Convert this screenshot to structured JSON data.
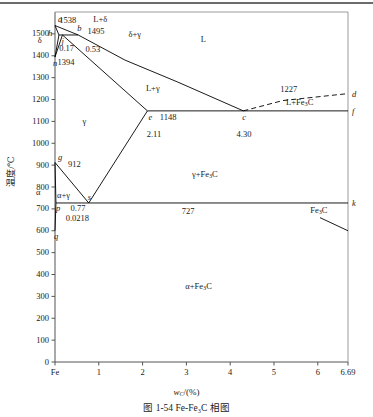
{
  "figure": {
    "caption": "图 1-54   Fe-Fe₃C 相图",
    "xlabel": "wC/(%)",
    "ylabel": "温度/℃",
    "top_rule_color": "#6b6b6b",
    "line_color": "#000000",
    "axis_color": "#555555"
  },
  "chart_data": {
    "type": "line",
    "title": "图 1-54   Fe-Fe₃C 相图",
    "xlabel": "wC/(%)",
    "ylabel": "温度/℃",
    "xlim": [
      0,
      6.69
    ],
    "ylim": [
      0,
      1600
    ],
    "grid": false,
    "legend": "none",
    "x_ticks": [
      {
        "value": 0,
        "label": "Fe"
      },
      {
        "value": 1,
        "label": "1"
      },
      {
        "value": 2,
        "label": "2"
      },
      {
        "value": 3,
        "label": "3"
      },
      {
        "value": 4,
        "label": "4"
      },
      {
        "value": 5,
        "label": "5"
      },
      {
        "value": 6,
        "label": "6"
      },
      {
        "value": 6.69,
        "label": "6.69"
      }
    ],
    "y_ticks": [
      {
        "value": 0,
        "label": "0"
      },
      {
        "value": 100,
        "label": "100"
      },
      {
        "value": 200,
        "label": "200"
      },
      {
        "value": 300,
        "label": "300"
      },
      {
        "value": 400,
        "label": "400"
      },
      {
        "value": 500,
        "label": "500"
      },
      {
        "value": 600,
        "label": "600"
      },
      {
        "value": 700,
        "label": "700"
      },
      {
        "value": 800,
        "label": "800"
      },
      {
        "value": 900,
        "label": "900"
      },
      {
        "value": 1000,
        "label": "1000"
      },
      {
        "value": 1100,
        "label": "1100"
      },
      {
        "value": 1200,
        "label": "1200"
      },
      {
        "value": 1300,
        "label": "1300"
      },
      {
        "value": 1400,
        "label": "1400"
      },
      {
        "value": 1500,
        "label": "1500"
      }
    ],
    "invariant_points": [
      {
        "id": "a",
        "label": "a",
        "wc": 0.0,
        "t": 1538
      },
      {
        "id": "h",
        "label": "h",
        "wc": 0.09,
        "t": 1495
      },
      {
        "id": "b",
        "label": "b",
        "wc": 0.53,
        "t": 1495
      },
      {
        "id": "j",
        "label": "j",
        "wc": 0.17,
        "t": 1495
      },
      {
        "id": "n",
        "label": "n",
        "wc": 0.0,
        "t": 1394
      },
      {
        "id": "e",
        "label": "e",
        "wc": 2.11,
        "t": 1148
      },
      {
        "id": "c",
        "label": "c",
        "wc": 4.3,
        "t": 1148
      },
      {
        "id": "f",
        "label": "f",
        "wc": 6.69,
        "t": 1148
      },
      {
        "id": "d",
        "label": "d",
        "wc": 6.69,
        "t": 1227
      },
      {
        "id": "g",
        "label": "g",
        "wc": 0.0,
        "t": 912
      },
      {
        "id": "s",
        "label": "s",
        "wc": 0.77,
        "t": 727
      },
      {
        "id": "p",
        "label": "p",
        "wc": 0.0218,
        "t": 727
      },
      {
        "id": "k",
        "label": "k",
        "wc": 6.69,
        "t": 727
      },
      {
        "id": "q",
        "label": "q",
        "wc": 0.0,
        "t": 600
      }
    ],
    "value_annotations": [
      {
        "text": "1538",
        "wc": 0.3,
        "t": 1560
      },
      {
        "text": "1495",
        "wc": 0.95,
        "t": 1512
      },
      {
        "text": "0.17",
        "wc": 0.3,
        "t": 1432
      },
      {
        "text": "0.53",
        "wc": 0.9,
        "t": 1430
      },
      {
        "text": "1394",
        "wc": 0.26,
        "t": 1370
      },
      {
        "text": "1227",
        "wc": 5.35,
        "t": 1245
      },
      {
        "text": "1148",
        "wc": 2.6,
        "t": 1120
      },
      {
        "text": "2.11",
        "wc": 2.3,
        "t": 1040
      },
      {
        "text": "4.30",
        "wc": 4.35,
        "t": 1040
      },
      {
        "text": "912",
        "wc": 0.5,
        "t": 905
      },
      {
        "text": "0.77",
        "wc": 0.56,
        "t": 700
      },
      {
        "text": "0.0218",
        "wc": 0.45,
        "t": 655
      },
      {
        "text": "727",
        "wc": 3.1,
        "t": 690
      }
    ],
    "phase_regions": [
      {
        "label": "L",
        "wc": 3.6,
        "t": 1470
      },
      {
        "label": "L+δ",
        "wc": 1.15,
        "t": 1562
      },
      {
        "label": "δ+γ",
        "wc": 1.95,
        "t": 1497
      },
      {
        "label": "δ",
        "wc": -0.12,
        "t": 1468
      },
      {
        "label": "L+γ",
        "wc": 2.35,
        "t": 1250
      },
      {
        "label": "L+Fe₃C",
        "wc": 5.55,
        "t": 1185
      },
      {
        "label": "γ",
        "wc": 0.9,
        "t": 1095
      },
      {
        "label": "γ+Fe₃C",
        "wc": 3.4,
        "t": 855
      },
      {
        "label": "α+γ",
        "wc": 0.32,
        "t": 760
      },
      {
        "label": "α",
        "wc": -0.16,
        "t": 772
      },
      {
        "label": "α+Fe₃C",
        "wc": 3.25,
        "t": 345
      },
      {
        "label": "Fe₃C",
        "wc": 6.1,
        "t": 690
      }
    ],
    "series": [
      {
        "name": "liquidus-AB-BC",
        "style": "solid",
        "points": [
          [
            0,
            1538
          ],
          [
            0.53,
            1495
          ],
          [
            1.6,
            1380
          ],
          [
            2.8,
            1280
          ],
          [
            4.3,
            1148
          ]
        ]
      },
      {
        "name": "liquidus-CD-dashed",
        "style": "dashed",
        "points": [
          [
            4.3,
            1148
          ],
          [
            5.2,
            1195
          ],
          [
            6.69,
            1227
          ]
        ]
      },
      {
        "name": "solidus-AH",
        "style": "solid",
        "points": [
          [
            0,
            1538
          ],
          [
            0.09,
            1495
          ]
        ]
      },
      {
        "name": "solvus-HN",
        "style": "solid",
        "points": [
          [
            0.09,
            1495
          ],
          [
            0,
            1394
          ]
        ]
      },
      {
        "name": "peritectic-HJB",
        "style": "solid",
        "points": [
          [
            0.09,
            1495
          ],
          [
            0.53,
            1495
          ]
        ]
      },
      {
        "name": "solidus-JE",
        "style": "solid",
        "points": [
          [
            0.17,
            1495
          ],
          [
            2.11,
            1148
          ]
        ]
      },
      {
        "name": "line-NJ",
        "style": "solid",
        "points": [
          [
            0,
            1394
          ],
          [
            0.17,
            1495
          ]
        ]
      },
      {
        "name": "eutectic-ECF",
        "style": "solid",
        "points": [
          [
            2.11,
            1148
          ],
          [
            6.69,
            1148
          ]
        ]
      },
      {
        "name": "solvus-ES",
        "style": "solid",
        "points": [
          [
            2.11,
            1148
          ],
          [
            0.77,
            727
          ]
        ]
      },
      {
        "name": "solvus-GS",
        "style": "solid",
        "points": [
          [
            0,
            912
          ],
          [
            0.77,
            727
          ]
        ]
      },
      {
        "name": "solvus-GP",
        "style": "solid",
        "points": [
          [
            0,
            912
          ],
          [
            0.0218,
            727
          ]
        ]
      },
      {
        "name": "eutectoid-PSK",
        "style": "solid",
        "points": [
          [
            0.0218,
            727
          ],
          [
            6.69,
            727
          ]
        ]
      },
      {
        "name": "solvus-PQ",
        "style": "solid",
        "points": [
          [
            0.0218,
            727
          ],
          [
            0,
            600
          ]
        ]
      },
      {
        "name": "fe3c-leader",
        "style": "solid",
        "points": [
          [
            6.05,
            660
          ],
          [
            6.69,
            600
          ]
        ]
      }
    ]
  }
}
